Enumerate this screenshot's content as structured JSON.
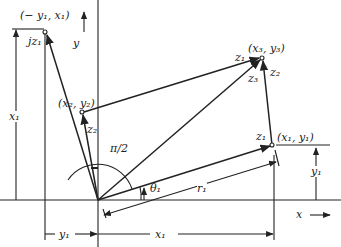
{
  "diagram": {
    "type": "complex-plane vector addition diagram",
    "labels": {
      "jz1_point": "(− y₁, x₁)",
      "jz1": "jz₁",
      "y_axis": "y",
      "x_axis": "x",
      "x1_left": "x₁",
      "z2_point": "(x₂, y₂)",
      "z2": "z₂",
      "angle_right": "π/2",
      "theta1": "θ₁",
      "r1": "r₁",
      "z1_point": "(x₁, y₁)",
      "z1": "z₁",
      "z3_point": "(x₃, y₃)",
      "z1_top": "z₁",
      "z2_right": "z₂",
      "z3": "z₃",
      "y1_right": "y₁",
      "y1_bottom": "y₁",
      "x1_bottom": "x₁"
    },
    "colors": {
      "line": "#222222",
      "background": "#ffffff"
    }
  }
}
